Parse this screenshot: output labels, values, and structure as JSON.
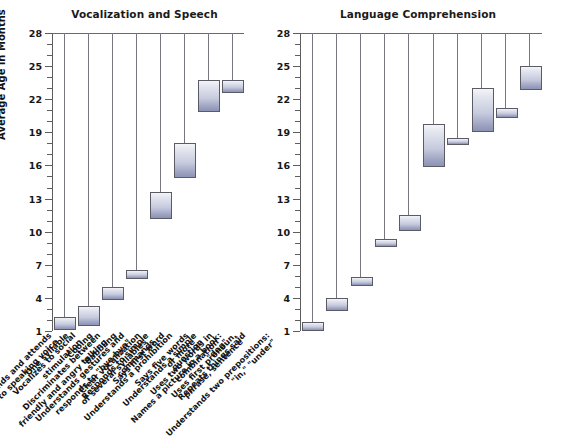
{
  "figure": {
    "y_axis_title": "Average Age in Months"
  },
  "chart_data": [
    {
      "type": "bar",
      "orientation": "vertical-range",
      "title": "Vocalization and Speech",
      "xlabel": "",
      "ylabel": "Average Age in Months",
      "ylim": [
        1,
        28
      ],
      "yticks": [
        1,
        4,
        7,
        10,
        13,
        16,
        19,
        22,
        25,
        28
      ],
      "minor_tick_step": 1,
      "grid": false,
      "legend": "none",
      "note": "Each bar is a range (low-high) of average age in months; a thin drop line connects the top of the plot to the bar.",
      "categories": [
        "One syllable",
        "Cooing",
        "Babbling",
        "Clear vocalization\nof several syllables",
        "Says first word",
        "Says five words\nor more",
        "Uses two words in\ncombination",
        "Uses first pronoun,\nphrase, sentence"
      ],
      "ranges": [
        {
          "label": "One syllable",
          "low": 1.3,
          "high": 2.3
        },
        {
          "label": "Cooing",
          "low": 1.6,
          "high": 3.3
        },
        {
          "label": "Babbling",
          "low": 4.0,
          "high": 5.0
        },
        {
          "label": "Clear vocalization of several syllables",
          "low": 5.9,
          "high": 6.5
        },
        {
          "label": "Says first word",
          "low": 11.3,
          "high": 13.6
        },
        {
          "label": "Says five words or more",
          "low": 15.0,
          "high": 18.0
        },
        {
          "label": "Uses two words in combination",
          "low": 21.0,
          "high": 23.7
        },
        {
          "label": "Uses first pronoun, phrase, sentence",
          "low": 22.7,
          "high": 23.7
        }
      ]
    },
    {
      "type": "bar",
      "orientation": "vertical-range",
      "title": "Language Comprehension",
      "xlabel": "",
      "ylabel": "Average Age in Months",
      "ylim": [
        1,
        28
      ],
      "yticks": [
        1,
        4,
        7,
        10,
        13,
        16,
        19,
        22,
        25,
        28
      ],
      "minor_tick_step": 1,
      "grid": false,
      "legend": "none",
      "note": "Each bar is a range (low-high) of average age in months; a thin drop line connects the top of the plot to the bar.",
      "categories": [
        "Responds and attends\nto speaking voice",
        "Vocalizes to social\nstimulation",
        "Discriminates between\nfriendly and angry talking",
        "Understands gestures and\nresponds to \"bye-bye\"",
        "Responds to simple\ncommands",
        "Understands a prohibition",
        "Understands a simple\nquestion",
        "Names a picture in a book:\n\"dog\"",
        "Repeats things said",
        "Understands two prepositions:\n\"in,\" \"under\""
      ],
      "ranges": [
        {
          "label": "Responds and attends to speaking voice",
          "low": 1.2,
          "high": 1.8
        },
        {
          "label": "Vocalizes to social stimulation",
          "low": 3.0,
          "high": 4.0
        },
        {
          "label": "Discriminates between friendly and angry talking",
          "low": 5.3,
          "high": 5.9
        },
        {
          "label": "Understands gestures and responds to \"bye-bye\"",
          "low": 8.8,
          "high": 9.3
        },
        {
          "label": "Responds to simple commands",
          "low": 10.2,
          "high": 11.5
        },
        {
          "label": "Understands a prohibition",
          "low": 16.0,
          "high": 19.8
        },
        {
          "label": "Understands a simple question",
          "low": 18.0,
          "high": 18.5
        },
        {
          "label": "Names a picture in a book: \"dog\"",
          "low": 19.2,
          "high": 23.0
        },
        {
          "label": "Repeats things said",
          "low": 20.5,
          "high": 21.2
        },
        {
          "label": "Understands two prepositions: \"in,\" \"under\"",
          "low": 23.0,
          "high": 25.0
        }
      ]
    }
  ],
  "colors": {
    "bar_fill_light": "#f4f5f9",
    "bar_fill_dark": "#8d93b4",
    "bar_stroke": "#5b5b66",
    "axis": "#5d5d5d",
    "text": "#131313",
    "background": "#ffffff"
  }
}
